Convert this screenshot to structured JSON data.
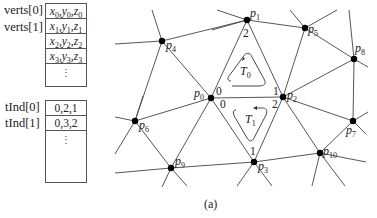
{
  "verts": {
    "labels": [
      "verts[0]",
      "verts[1]"
    ],
    "cells": [
      {
        "x": "x",
        "y": "y",
        "z": "z",
        "i": "0"
      },
      {
        "x": "x",
        "y": "y",
        "z": "z",
        "i": "1"
      },
      {
        "x": "x",
        "y": "y",
        "z": "z",
        "i": "2"
      },
      {
        "x": "x",
        "y": "y",
        "z": "z",
        "i": "3"
      }
    ],
    "ellipsis": "⋮"
  },
  "tInd": {
    "labels": [
      "tInd[0]",
      "tInd[1]"
    ],
    "cells": [
      "0,2,1",
      "0,3,2"
    ],
    "ellipsis": "⋮"
  },
  "mesh": {
    "nodes": [
      {
        "id": "p0",
        "name": "p",
        "sub": "0",
        "x": 211,
        "y": 98
      },
      {
        "id": "p1",
        "name": "p",
        "sub": "1",
        "x": 247,
        "y": 20
      },
      {
        "id": "p2",
        "name": "p",
        "sub": "2",
        "x": 283,
        "y": 97
      },
      {
        "id": "p3",
        "name": "p",
        "sub": "3",
        "x": 254,
        "y": 162
      },
      {
        "id": "p4",
        "name": "p",
        "sub": "4",
        "x": 162,
        "y": 41
      },
      {
        "id": "p5",
        "name": "p",
        "sub": "5",
        "x": 305,
        "y": 28
      },
      {
        "id": "p6",
        "name": "p",
        "sub": "6",
        "x": 135,
        "y": 121
      },
      {
        "id": "p7",
        "name": "p",
        "sub": "7",
        "x": 353,
        "y": 121
      },
      {
        "id": "p8",
        "name": "p",
        "sub": "8",
        "x": 354,
        "y": 59
      },
      {
        "id": "p9",
        "name": "p",
        "sub": "9",
        "x": 171,
        "y": 168
      },
      {
        "id": "p10",
        "name": "p",
        "sub": "10",
        "x": 320,
        "y": 153
      }
    ],
    "triangles": [
      {
        "name": "T",
        "sub": "0",
        "corners": [
          "0",
          "2",
          "1"
        ]
      },
      {
        "name": "T",
        "sub": "1",
        "corners": [
          "0",
          "1",
          "2"
        ]
      }
    ]
  },
  "caption": "(a)"
}
